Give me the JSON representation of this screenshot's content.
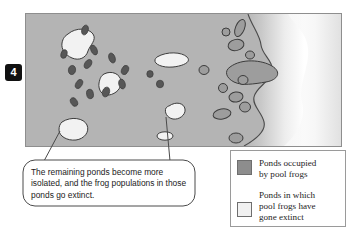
{
  "figure": {
    "number": "4"
  },
  "callout": {
    "text": "The remaining ponds become more isolated, and the frog populations in those ponds go extinct."
  },
  "legend": {
    "items": [
      {
        "swatch_color": "#8d8d8d",
        "label": "Ponds occupied\nby pool frogs"
      },
      {
        "swatch_color": "#f1f1f1",
        "label": "Ponds in which\npool frogs have\ngone extinct"
      }
    ]
  },
  "map": {
    "land_color": "#b4b4b4",
    "sea_color": "#ffffff",
    "occupied_pond_color": "#9d9d9d",
    "extinct_pond_color": "#f2f2f2",
    "dark_marker_color": "#575757",
    "outline_color": "#3c3c3c",
    "ponds_occupied_count": 12,
    "ponds_extinct_count": 6,
    "dark_markers_count": 14
  }
}
